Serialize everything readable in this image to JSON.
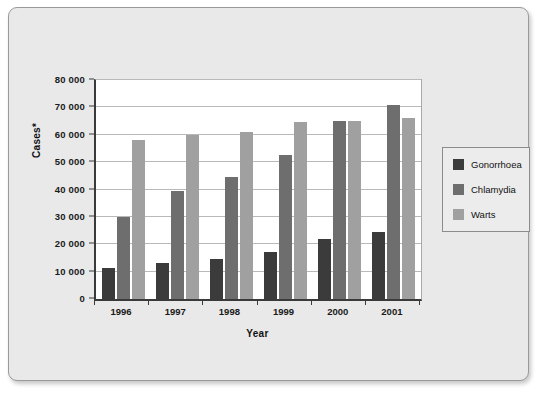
{
  "chart_data": {
    "type": "bar",
    "title": "",
    "xlabel": "Year",
    "ylabel": "Cases*",
    "categories": [
      "1996",
      "1997",
      "1998",
      "1999",
      "2000",
      "2001"
    ],
    "series": [
      {
        "name": "Gonorrhoea",
        "color": "#3b3b3b",
        "values": [
          11500,
          13000,
          14500,
          17000,
          22000,
          24500
        ]
      },
      {
        "name": "Chlamydia",
        "color": "#6e6e6e",
        "values": [
          30000,
          39500,
          44500,
          52500,
          65000,
          71000
        ]
      },
      {
        "name": "Warts",
        "color": "#a0a0a0",
        "values": [
          58000,
          60000,
          61000,
          64500,
          65000,
          66000
        ]
      }
    ],
    "ylim": [
      0,
      80000
    ],
    "ytick_values": [
      0,
      10000,
      20000,
      30000,
      40000,
      50000,
      60000,
      70000,
      80000
    ],
    "ytick_labels": [
      "0",
      "10 000",
      "20 000",
      "30 000",
      "40 000",
      "50 000",
      "60 000",
      "70 000",
      "80 000"
    ],
    "grid": true,
    "legend_position": "right"
  }
}
